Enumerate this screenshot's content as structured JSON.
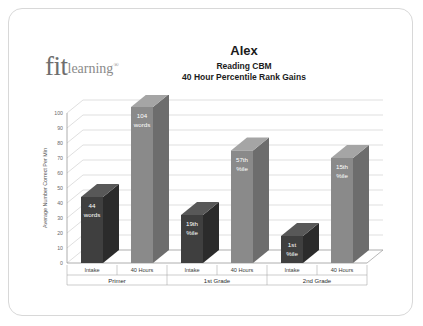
{
  "card": {
    "logo": {
      "mark": "fit",
      "word": "learning",
      "registered": "®"
    },
    "title": "Alex",
    "subtitle_line1": "Reading CBM",
    "subtitle_line2": "40 Hour Percentile Rank Gains"
  },
  "colors": {
    "bar_intake": "#3f3f3f",
    "bar_intake_side": "#2b2b2b",
    "bar_intake_top": "#585858",
    "bar_forty": "#8a8a8a",
    "bar_forty_side": "#6d6d6d",
    "bar_forty_top": "#a5a5a5",
    "grid": "#c9c9c9",
    "axis": "#9a9a9a",
    "card_border": "#d8d8d8",
    "label_text": "#ffffff"
  },
  "chart_data": {
    "type": "bar",
    "title": "Alex",
    "subtitle": "Reading CBM — 40 Hour Percentile Rank Gains",
    "xlabel": "",
    "ylabel": "Average Number Correct Per Min",
    "ylim": [
      0,
      100
    ],
    "yticks": [
      0,
      10,
      20,
      30,
      40,
      50,
      60,
      70,
      80,
      90,
      100
    ],
    "ytick_labels": [
      "0",
      "10",
      "20",
      "30",
      "40",
      "50",
      "60",
      "70",
      "80",
      "90",
      "100"
    ],
    "grid": true,
    "legend": "none",
    "style": "3d-column",
    "categories": [
      "Primer",
      "1st Grade",
      "2nd Grade"
    ],
    "subcategories": [
      "Intake",
      "40 Hours"
    ],
    "series": [
      {
        "name": "Intake",
        "values": [
          44,
          32,
          18
        ]
      },
      {
        "name": "40 Hours",
        "values": [
          104,
          75,
          70
        ]
      }
    ],
    "bars": [
      {
        "group": "Primer",
        "subcategory": "Intake",
        "value": 44,
        "label_line1": "44",
        "label_line2": "words",
        "color": "#3f3f3f"
      },
      {
        "group": "Primer",
        "subcategory": "40 Hours",
        "value": 104,
        "label_line1": "104",
        "label_line2": "words",
        "color": "#8a8a8a"
      },
      {
        "group": "1st Grade",
        "subcategory": "Intake",
        "value": 32,
        "label_line1": "19th",
        "label_line2": "%ile",
        "color": "#3f3f3f"
      },
      {
        "group": "1st Grade",
        "subcategory": "40 Hours",
        "value": 75,
        "label_line1": "57th",
        "label_line2": "%ile",
        "color": "#8a8a8a"
      },
      {
        "group": "2nd Grade",
        "subcategory": "Intake",
        "value": 18,
        "label_line1": "1st",
        "label_line2": "%ile",
        "color": "#3f3f3f"
      },
      {
        "group": "2nd Grade",
        "subcategory": "40 Hours",
        "value": 70,
        "label_line1": "15th",
        "label_line2": "%ile",
        "color": "#8a8a8a"
      }
    ],
    "annotations": [
      "44 words",
      "104 words",
      "19th %ile",
      "57th %ile",
      "1st %ile",
      "15th %ile"
    ]
  }
}
